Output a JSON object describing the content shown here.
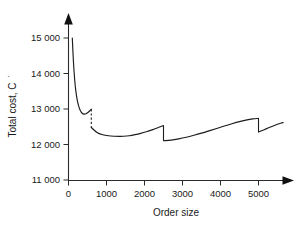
{
  "chart_data": {
    "type": "line",
    "title": "",
    "subtitle": "",
    "xlabel": "Order size",
    "ylabel": "Total cost, C",
    "ylabel_superscript": "′",
    "xlim": [
      0,
      5900
    ],
    "ylim": [
      11000,
      15400
    ],
    "xticks": [
      0,
      1000,
      2000,
      3000,
      4000,
      5000
    ],
    "xticklabels": [
      "0",
      "1000",
      "2000",
      "3000",
      "4000",
      "5000"
    ],
    "yticks": [
      11000,
      12000,
      13000,
      14000,
      15000
    ],
    "yticklabels": [
      "11 000",
      "12 000",
      "13 000",
      "14 000",
      "15 000"
    ],
    "grid": false,
    "legend": null,
    "axis_arrows": true,
    "line_color": "#1c1c1c",
    "axis_color": "#2a2a2a",
    "background_color": "#ffffff",
    "break_points": [
      600,
      2500,
      5000
    ],
    "annotations": [],
    "series": [
      {
        "name": "Price band 1 (0 - 600)",
        "x": [
          100,
          130,
          160,
          190,
          230,
          270,
          310,
          360,
          410,
          460,
          510,
          560,
          600
        ],
        "y": [
          15000,
          14330,
          13860,
          13530,
          13250,
          13075,
          12960,
          12880,
          12855,
          12865,
          12900,
          12950,
          12995
        ]
      },
      {
        "name": "Price band 2 (600 - 2500)",
        "x": [
          600,
          750,
          900,
          1050,
          1200,
          1350,
          1450,
          1600,
          1750,
          1900,
          2050,
          2200,
          2350,
          2500
        ],
        "y": [
          12480,
          12340,
          12275,
          12245,
          12232,
          12228,
          12231,
          12248,
          12278,
          12315,
          12360,
          12412,
          12470,
          12535
        ]
      },
      {
        "name": "Price band 3 (2500 - 5000)",
        "x": [
          2500,
          2700,
          2900,
          3100,
          3300,
          3500,
          3700,
          3900,
          4100,
          4300,
          4500,
          4700,
          4850,
          5000
        ],
        "y": [
          12105,
          12125,
          12160,
          12205,
          12260,
          12320,
          12385,
          12450,
          12520,
          12585,
          12645,
          12695,
          12720,
          12735
        ]
      },
      {
        "name": "Price band 4 (5000 - 5650)",
        "x": [
          5000,
          5100,
          5200,
          5300,
          5400,
          5500,
          5600,
          5650
        ],
        "y": [
          12350,
          12395,
          12440,
          12485,
          12530,
          12570,
          12605,
          12620
        ]
      }
    ],
    "discontinuities": [
      {
        "x": 600,
        "y_top": 12995,
        "y_bottom": 12480,
        "style": "dashed"
      },
      {
        "x": 2500,
        "y_top": 12535,
        "y_bottom": 12105,
        "style": "solid"
      },
      {
        "x": 5000,
        "y_top": 12735,
        "y_bottom": 12350,
        "style": "solid"
      }
    ]
  }
}
